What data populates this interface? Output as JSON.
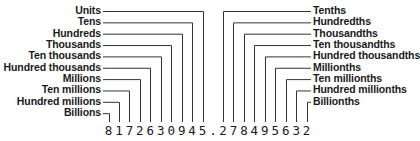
{
  "number": {
    "whole_digits": [
      "8",
      "1",
      "7",
      "2",
      "6",
      "3",
      "0",
      "9",
      "4",
      "5"
    ],
    "decimal_point": ".",
    "fraction_digits": [
      "2",
      "7",
      "8",
      "4",
      "9",
      "5",
      "6",
      "3",
      "2"
    ]
  },
  "left_labels": [
    {
      "text": "Units",
      "digit_index": 9
    },
    {
      "text": "Tens",
      "digit_index": 8
    },
    {
      "text": "Hundreds",
      "digit_index": 7
    },
    {
      "text": "Thousands",
      "digit_index": 6
    },
    {
      "text": "Ten thousands",
      "digit_index": 5
    },
    {
      "text": "Hundred thousands",
      "digit_index": 4
    },
    {
      "text": "Millions",
      "digit_index": 3
    },
    {
      "text": "Ten millions",
      "digit_index": 2
    },
    {
      "text": "Hundred millions",
      "digit_index": 1
    },
    {
      "text": "Billions",
      "digit_index": 0
    }
  ],
  "right_labels": [
    {
      "text": "Tenths",
      "digit_index": 0
    },
    {
      "text": "Hundredths",
      "digit_index": 1
    },
    {
      "text": "Thousandths",
      "digit_index": 2
    },
    {
      "text": "Ten thousandths",
      "digit_index": 3
    },
    {
      "text": "Hundred thousandths",
      "digit_index": 4
    },
    {
      "text": "Millionths",
      "digit_index": 5
    },
    {
      "text": "Ten millionths",
      "digit_index": 6
    },
    {
      "text": "Hundred millionths",
      "digit_index": 7
    },
    {
      "text": "Billionths",
      "digit_index": 8
    }
  ],
  "colors": {
    "ink": "#1a1a1a",
    "line": "#333333",
    "background": "#ffffff"
  }
}
